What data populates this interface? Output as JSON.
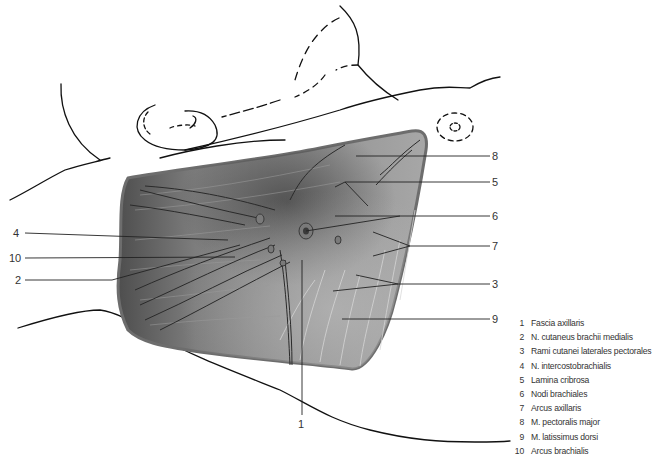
{
  "figure": {
    "title": "",
    "colors": {
      "line": "#111111",
      "tissue_dark": "#5a5a5a",
      "tissue_mid": "#8c8c8c",
      "tissue_light": "#b0b0b0",
      "outline": "#6f6f6f"
    }
  },
  "callouts": {
    "left": [
      {
        "num": "4"
      },
      {
        "num": "10"
      },
      {
        "num": "2"
      }
    ],
    "right": [
      {
        "num": "8"
      },
      {
        "num": "5"
      },
      {
        "num": "6"
      },
      {
        "num": "7"
      },
      {
        "num": "3"
      },
      {
        "num": "9"
      }
    ],
    "bottom": [
      {
        "num": "1"
      }
    ]
  },
  "legend": {
    "items": [
      {
        "num": "1",
        "label": "Fascia axillaris"
      },
      {
        "num": "2",
        "label": "N. cutaneus brachii medialis"
      },
      {
        "num": "3",
        "label": "Rami cutanei laterales pectorales"
      },
      {
        "num": "4",
        "label": "N. intercostobrachialis"
      },
      {
        "num": "5",
        "label": "Lamina cribrosa"
      },
      {
        "num": "6",
        "label": "Nodi brachiales"
      },
      {
        "num": "7",
        "label": "Arcus axillaris"
      },
      {
        "num": "8",
        "label": "M. pectoralis major"
      },
      {
        "num": "9",
        "label": "M. latissimus dorsi"
      },
      {
        "num": "10",
        "label": "Arcus brachialis"
      }
    ]
  }
}
